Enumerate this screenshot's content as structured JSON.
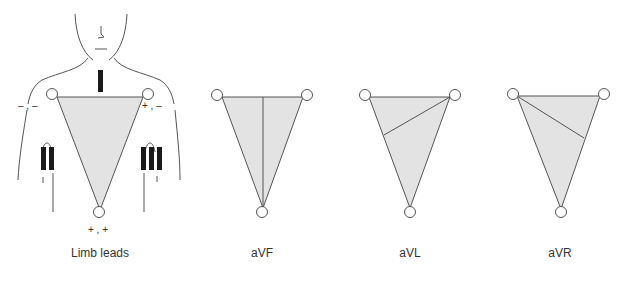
{
  "colors": {
    "stroke": "#555555",
    "fill": "#e3e3e3",
    "bar": "#1a1a1a",
    "text": "#333333"
  },
  "panels": [
    {
      "id": "limb-leads",
      "label": "Limb leads"
    },
    {
      "id": "avf",
      "label": "aVF"
    },
    {
      "id": "avl",
      "label": "aVL"
    },
    {
      "id": "avr",
      "label": "aVR"
    }
  ],
  "limb_leads": {
    "lead_markers": [
      "I",
      "II",
      "III"
    ],
    "polarity": {
      "right_arm": "– , –",
      "left_arm": "+ , –",
      "left_leg": "+ , +"
    }
  }
}
